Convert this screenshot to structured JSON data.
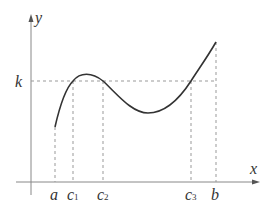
{
  "diagram": {
    "type": "function-graph",
    "axes": {
      "x_label": "x",
      "y_label": "y"
    },
    "level": {
      "label": "k"
    },
    "x_ticks": [
      {
        "id": "a",
        "base": "a",
        "sub": ""
      },
      {
        "id": "c1",
        "base": "c",
        "sub": "1"
      },
      {
        "id": "c2",
        "base": "c",
        "sub": "2"
      },
      {
        "id": "c3",
        "base": "c",
        "sub": "3"
      },
      {
        "id": "b",
        "base": "b",
        "sub": ""
      }
    ],
    "curve": {
      "description": "Continuous function on [a, b] crossing y = k at c1, c2, c3",
      "color": "#333333"
    },
    "colors": {
      "axis": "#888888",
      "dashed": "#999999",
      "curve": "#333333",
      "text": "#333333"
    }
  }
}
